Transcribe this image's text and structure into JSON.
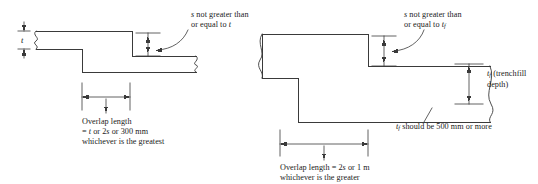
{
  "figure": {
    "type": "engineering-section-diagram",
    "line_color": "#3a3a3a",
    "text_color": "#1a1a1a",
    "background": "#ffffff",
    "diagrams": [
      {
        "id": "strip-foundation",
        "position": "left",
        "labels": {
          "thickness_symbol": "t",
          "step_note_line1": "s not greater than",
          "step_note_line2": "or equal to t",
          "overlap_line1": "Overlap length",
          "overlap_line2": "= t or 2s or 300 mm",
          "overlap_line3": "whichever is the greatest"
        },
        "symbols": {
          "step_height": "s",
          "foundation_thickness": "t",
          "overlap_minimum_mm": 300,
          "overlap_rule": "t or 2s or 300 mm, whichever is the greatest"
        }
      },
      {
        "id": "trenchfill-foundation",
        "position": "right",
        "labels": {
          "step_note_line1": "s not greater than",
          "step_note_line2": "or equal to tf",
          "depth_line1": "tf (trenchfill",
          "depth_line2": "depth)",
          "depth_rule": "tf should be 500 mm or more",
          "overlap_line1": "Overlap length = 2s or 1 m",
          "overlap_line2": "whichever is the greater"
        },
        "symbols": {
          "step_height": "s",
          "trenchfill_depth": "tf",
          "depth_minimum_mm": 500,
          "overlap_minimum": "1 m",
          "overlap_rule": "2s or 1 m, whichever is the greater"
        }
      }
    ]
  }
}
